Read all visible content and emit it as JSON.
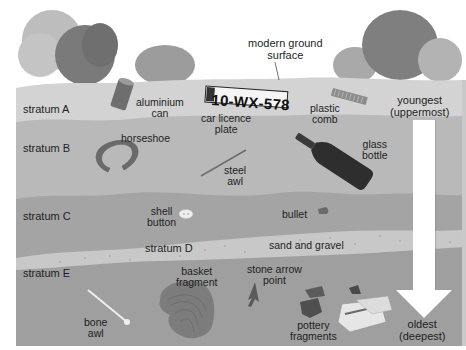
{
  "surface_label": "modern ground surface",
  "strata": [
    {
      "id": "A",
      "label": "stratum A",
      "color": "#d3d3d3"
    },
    {
      "id": "B",
      "label": "stratum B",
      "color": "#b9b9b9"
    },
    {
      "id": "C",
      "label": "stratum C",
      "color": "#a4a4a4"
    },
    {
      "id": "D",
      "label": "stratum D",
      "color": "#c8c8c8",
      "note": "sand and gravel"
    },
    {
      "id": "E",
      "label": "stratum E",
      "color": "#9f9f9f"
    }
  ],
  "labels": {
    "surface_line1": "modern ground",
    "surface_line2": "surface",
    "stratum_a": "stratum A",
    "stratum_b": "stratum B",
    "stratum_c": "stratum C",
    "stratum_d": "stratum D",
    "stratum_e": "stratum E",
    "aluminium_can_1": "aluminium",
    "aluminium_can_2": "can",
    "licence_plate_1": "car licence",
    "licence_plate_2": "plate",
    "licence_plate_text": "10-WX-578",
    "plastic_comb_1": "plastic",
    "plastic_comb_2": "comb",
    "horseshoe": "horseshoe",
    "steel_awl_1": "steel",
    "steel_awl_2": "awl",
    "glass_bottle_1": "glass",
    "glass_bottle_2": "bottle",
    "shell_button_1": "shell",
    "shell_button_2": "button",
    "bullet": "bullet",
    "sand_gravel": "sand and gravel",
    "basket_1": "basket",
    "basket_2": "fragment",
    "arrow_point_1": "stone arrow",
    "arrow_point_2": "point",
    "bone_awl_1": "bone",
    "bone_awl_2": "awl",
    "pottery_1": "pottery",
    "pottery_2": "fragments",
    "youngest_1": "youngest",
    "youngest_2": "(uppermost)",
    "oldest_1": "oldest",
    "oldest_2": "(deepest)"
  },
  "colors": {
    "stratum_a": "#d3d3d3",
    "stratum_b": "#b9b9b9",
    "stratum_c": "#a4a4a4",
    "stratum_d": "#c8c8c8",
    "stratum_e": "#9f9f9f",
    "arrow": "#ffffff",
    "text": "#1e1e1e"
  }
}
